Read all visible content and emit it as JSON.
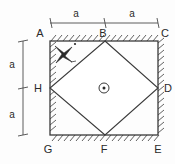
{
  "figure": {
    "kind": "geometry-diagram",
    "colors": {
      "line": "#3a3a3a",
      "text": "#2a2a2a",
      "background": "#fdfdfd",
      "fill": "#ffffff"
    },
    "vertex_labels": [
      {
        "name": "A",
        "text": "A",
        "x": 40,
        "y": 37,
        "position": "top-left-corner"
      },
      {
        "name": "B",
        "text": "B",
        "x": 102,
        "y": 37,
        "position": "top-mid"
      },
      {
        "name": "C",
        "text": "C",
        "x": 160,
        "y": 37,
        "position": "top-right-corner"
      },
      {
        "name": "D",
        "text": "D",
        "x": 162,
        "y": 92,
        "position": "right-mid"
      },
      {
        "name": "E",
        "text": "E",
        "x": 155,
        "y": 152,
        "position": "bottom-right-corner"
      },
      {
        "name": "F",
        "text": "F",
        "x": 101,
        "y": 152,
        "position": "bottom-mid"
      },
      {
        "name": "G",
        "text": "G",
        "x": 43,
        "y": 152,
        "position": "bottom-left-corner"
      },
      {
        "name": "H",
        "text": "H",
        "x": 34,
        "y": 92,
        "position": "left-mid"
      }
    ],
    "dimensions": {
      "top": {
        "label_left": "a",
        "label_right": "a",
        "label_left_x": 76,
        "label_right_x": 132,
        "label_y": 17,
        "line_y": 23,
        "x_start": 50,
        "x_mid": 105,
        "x_end": 158
      },
      "left": {
        "label_top": "a",
        "label_bottom": "a",
        "label_x": 12,
        "label_top_y": 64,
        "label_bottom_y": 120,
        "line_x": 23,
        "y_start": 41,
        "y_mid": 88,
        "y_end": 135
      }
    },
    "square": {
      "left": 50,
      "top": 41,
      "right": 158,
      "bottom": 135
    },
    "symbols": [
      {
        "name": "cross-mark",
        "glyph": "X",
        "x": 63,
        "y": 53,
        "note": "hand-drawn four-point star mark with dot and dash"
      },
      {
        "name": "out-of-page-vector",
        "glyph": "circled-dot",
        "x": 104,
        "y": 88,
        "note": "circle with center dot indicating vector out of page"
      }
    ]
  }
}
